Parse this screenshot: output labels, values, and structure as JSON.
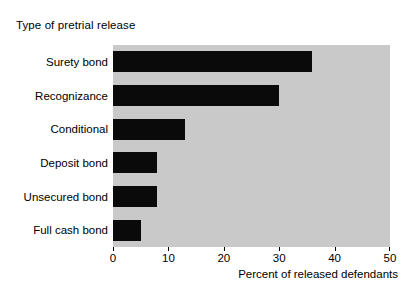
{
  "chart_data": {
    "type": "bar",
    "orientation": "horizontal",
    "title": "Type of pretrial release",
    "xlabel": "Percent of released defendants",
    "ylabel": "",
    "categories": [
      "Surety bond",
      "Recognizance",
      "Conditional",
      "Deposit bond",
      "Unsecured bond",
      "Full cash bond"
    ],
    "values": [
      36,
      30,
      13,
      8,
      8,
      5
    ],
    "xlim": [
      0,
      50
    ],
    "xticks": [
      0,
      10,
      20,
      30,
      40,
      50
    ],
    "xtick_labels": [
      "0",
      "10",
      "20",
      "30",
      "40",
      "50"
    ],
    "grid": false,
    "legend": null,
    "bar_color": "#0a0a0a",
    "plot_background": "#c9c9c9",
    "figure_background": "#ffffff"
  }
}
